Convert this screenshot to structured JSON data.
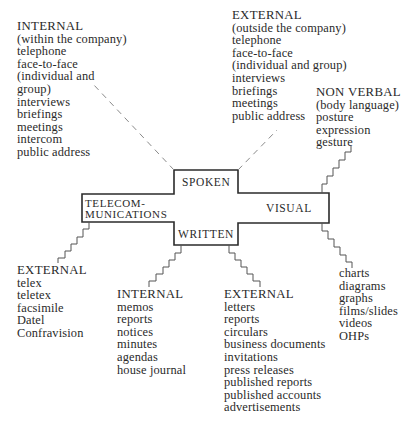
{
  "diagram": {
    "center_labels": {
      "spoken": "SPOKEN",
      "written": "WRITTEN",
      "visual": "VISUAL",
      "telecom_line1": "TELECOM-",
      "telecom_line2": "MUNICATIONS"
    },
    "spoken_internal": {
      "heading": "INTERNAL",
      "items": [
        "(within the company)",
        "telephone",
        "face-to-face",
        "(individual and",
        "group)",
        "interviews",
        "briefings",
        "meetings",
        "intercom",
        "public address"
      ]
    },
    "spoken_external": {
      "heading": "EXTERNAL",
      "items": [
        "(outside the company)",
        "telephone",
        "face-to-face",
        "(individual and group)",
        "interviews",
        "briefings",
        "meetings",
        "public address"
      ]
    },
    "visual_nonverbal": {
      "heading": "NON VERBAL",
      "items": [
        "(body language)",
        "posture",
        "expression",
        "gesture"
      ]
    },
    "visual_media": {
      "items": [
        "charts",
        "diagrams",
        "graphs",
        "films/slides",
        "videos",
        "OHPs"
      ]
    },
    "telecom_external": {
      "heading": "EXTERNAL",
      "items": [
        "telex",
        "teletex",
        "facsimile",
        "Datel",
        "Confravision"
      ]
    },
    "written_internal": {
      "heading": "INTERNAL",
      "items": [
        "memos",
        "reports",
        "notices",
        "minutes",
        "agendas",
        "house journal"
      ]
    },
    "written_external": {
      "heading": "EXTERNAL",
      "items": [
        "letters",
        "reports",
        "circulars",
        "business documents",
        "invitations",
        "press releases",
        "published reports",
        "published accounts",
        "advertisements"
      ]
    },
    "colors": {
      "line": "#2b2b2b",
      "dash": "#8a8a8a",
      "text": "#2a2a2a"
    }
  }
}
